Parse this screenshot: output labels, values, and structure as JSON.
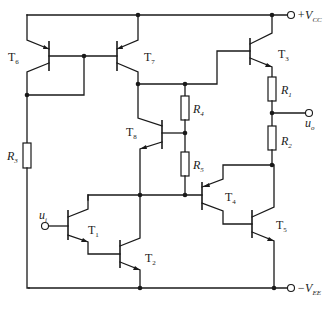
{
  "diagram": {
    "type": "circuit-schematic",
    "supplies": {
      "positive": {
        "main": "+V",
        "sub": "CC"
      },
      "negative": {
        "main": "−V",
        "sub": "EE"
      }
    },
    "ports": {
      "input": {
        "main": "u",
        "sub": "i"
      },
      "output": {
        "main": "u",
        "sub": "o"
      }
    },
    "transistors": [
      {
        "id": "T1",
        "main": "T",
        "sub": "1",
        "type": "NPN"
      },
      {
        "id": "T2",
        "main": "T",
        "sub": "2",
        "type": "NPN"
      },
      {
        "id": "T3",
        "main": "T",
        "sub": "3",
        "type": "NPN"
      },
      {
        "id": "T4",
        "main": "T",
        "sub": "4",
        "type": "PNP"
      },
      {
        "id": "T5",
        "main": "T",
        "sub": "5",
        "type": "NPN"
      },
      {
        "id": "T6",
        "main": "T",
        "sub": "6",
        "type": "PNP"
      },
      {
        "id": "T7",
        "main": "T",
        "sub": "7",
        "type": "PNP"
      },
      {
        "id": "T8",
        "main": "T",
        "sub": "8",
        "type": "PNP"
      }
    ],
    "resistors": [
      {
        "id": "R1",
        "main": "R",
        "sub": "1"
      },
      {
        "id": "R2",
        "main": "R",
        "sub": "2"
      },
      {
        "id": "R3",
        "main": "R",
        "sub": "3"
      },
      {
        "id": "R4",
        "main": "R",
        "sub": "4"
      },
      {
        "id": "R5",
        "main": "R",
        "sub": "5"
      }
    ]
  }
}
